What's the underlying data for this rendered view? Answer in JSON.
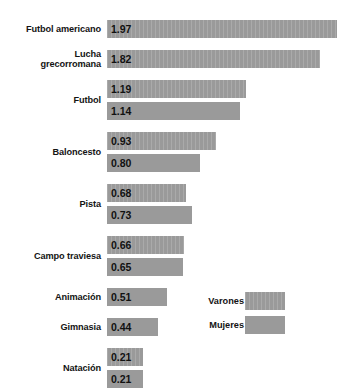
{
  "chart_data": {
    "type": "bar",
    "orientation": "horizontal",
    "title": "",
    "subtitle": "",
    "xlabel": "",
    "ylabel": "",
    "xlim": [
      0,
      1.97
    ],
    "grid": false,
    "legend_position": "middle-right",
    "value_format": "2-decimals",
    "categories": [
      "Futbol americano",
      "Lucha grecorromana",
      "Futbol",
      "Baloncesto",
      "Pista",
      "Campo traviesa",
      "Animación",
      "Gimnasia",
      "Natación"
    ],
    "series": [
      {
        "name": "Varones",
        "values": [
          1.97,
          1.82,
          1.19,
          0.93,
          0.68,
          0.66,
          null,
          null,
          0.21
        ]
      },
      {
        "name": "Mujeres",
        "values": [
          null,
          null,
          1.14,
          0.8,
          0.73,
          0.65,
          0.51,
          0.44,
          0.21
        ]
      }
    ],
    "legend": [
      {
        "label": "Varones",
        "swatch": "striped-grey"
      },
      {
        "label": "Mujeres",
        "swatch": "solid-grey"
      }
    ],
    "colors": {
      "bar_fill": "#9a9a9a",
      "background": "#ffffff",
      "text": "#141414"
    }
  },
  "groups": [
    {
      "label": "Futbol americano",
      "label_lines": [
        "Futbol americano"
      ],
      "bars": [
        {
          "series": "Varones",
          "value": "1.97",
          "value_num": 1.97
        }
      ]
    },
    {
      "label": "Lucha grecorromana",
      "label_lines": [
        "Lucha",
        "grecorromana"
      ],
      "bars": [
        {
          "series": "Varones",
          "value": "1.82",
          "value_num": 1.82
        }
      ]
    },
    {
      "label": "Futbol",
      "label_lines": [
        "Futbol"
      ],
      "bars": [
        {
          "series": "Varones",
          "value": "1.19",
          "value_num": 1.19
        },
        {
          "series": "Mujeres",
          "value": "1.14",
          "value_num": 1.14
        }
      ]
    },
    {
      "label": "Baloncesto",
      "label_lines": [
        "Baloncesto"
      ],
      "bars": [
        {
          "series": "Varones",
          "value": "0.93",
          "value_num": 0.93
        },
        {
          "series": "Mujeres",
          "value": "0.80",
          "value_num": 0.8
        }
      ]
    },
    {
      "label": "Pista",
      "label_lines": [
        "Pista"
      ],
      "bars": [
        {
          "series": "Varones",
          "value": "0.68",
          "value_num": 0.68
        },
        {
          "series": "Mujeres",
          "value": "0.73",
          "value_num": 0.73
        }
      ]
    },
    {
      "label": "Campo traviesa",
      "label_lines": [
        "Campo traviesa"
      ],
      "bars": [
        {
          "series": "Varones",
          "value": "0.66",
          "value_num": 0.66
        },
        {
          "series": "Mujeres",
          "value": "0.65",
          "value_num": 0.65
        }
      ]
    },
    {
      "label": "Animación",
      "label_lines": [
        "Animación"
      ],
      "bars": [
        {
          "series": "Mujeres",
          "value": "0.51",
          "value_num": 0.51
        }
      ]
    },
    {
      "label": "Gimnasia",
      "label_lines": [
        "Gimnasia"
      ],
      "bars": [
        {
          "series": "Mujeres",
          "value": "0.44",
          "value_num": 0.44
        }
      ]
    },
    {
      "label": "Natación",
      "label_lines": [
        "Natación"
      ],
      "bars": [
        {
          "series": "Varones",
          "value": "0.21",
          "value_num": 0.21
        },
        {
          "series": "Mujeres",
          "value": "0.21",
          "value_num": 0.21
        }
      ]
    }
  ],
  "legend": {
    "items": [
      {
        "label": "Varones",
        "style": "varones"
      },
      {
        "label": "Mujeres",
        "style": "mujeres"
      }
    ]
  }
}
